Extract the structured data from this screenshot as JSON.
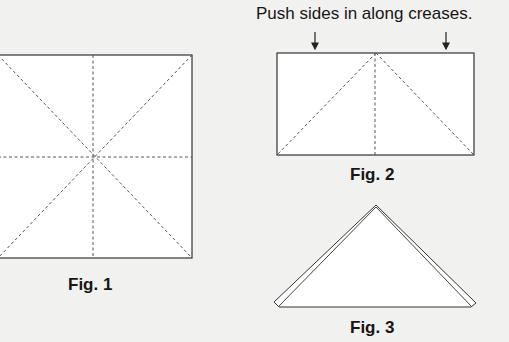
{
  "instruction": "Push sides in along creases.",
  "figures": [
    {
      "label": "Fig. 1",
      "description": "square with diagonal and midline creases"
    },
    {
      "label": "Fig. 2",
      "description": "rectangle with creases from top center"
    },
    {
      "label": "Fig. 3",
      "description": "folded triangle"
    }
  ],
  "colors": {
    "background": "#f1f1ef",
    "paper": "#ffffff",
    "line": "#333333",
    "crease": "#555555"
  }
}
